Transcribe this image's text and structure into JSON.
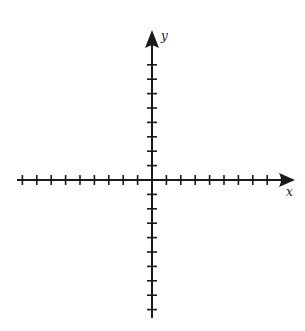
{
  "diagram": {
    "type": "coordinate-plane",
    "x_axis": {
      "label": "x",
      "ticks_negative": 9,
      "ticks_positive": 9,
      "arrow": "positive-end"
    },
    "y_axis": {
      "label": "y",
      "ticks_positive": 8,
      "ticks_negative": 9,
      "arrow": "positive-end"
    },
    "tick_numbers_shown": false,
    "grid": false
  },
  "colors": {
    "line": "#1a1a1a",
    "background": "#ffffff"
  }
}
